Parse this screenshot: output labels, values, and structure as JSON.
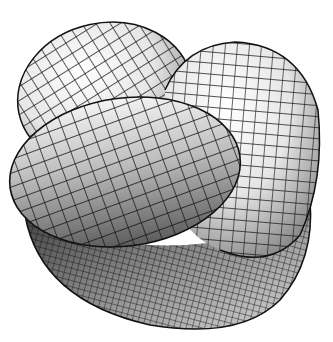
{
  "figure": {
    "background": "#ffffff",
    "mesh_color": "#1a1a1a",
    "lobes": [
      {
        "name": "back-left-lobe",
        "cx": 103,
        "cy": 90,
        "rx": 85,
        "ry": 70,
        "rot": -15
      },
      {
        "name": "right-lobe",
        "cx": 240,
        "cy": 150,
        "rx": 82,
        "ry": 112,
        "rot": 10
      },
      {
        "name": "front-lobe",
        "cx": 125,
        "cy": 175,
        "rx": 115,
        "ry": 75,
        "rot": -10
      },
      {
        "name": "bottom-bowl",
        "cx": 185,
        "cy": 250,
        "rx": 145,
        "ry": 75,
        "rot": 10
      }
    ]
  }
}
